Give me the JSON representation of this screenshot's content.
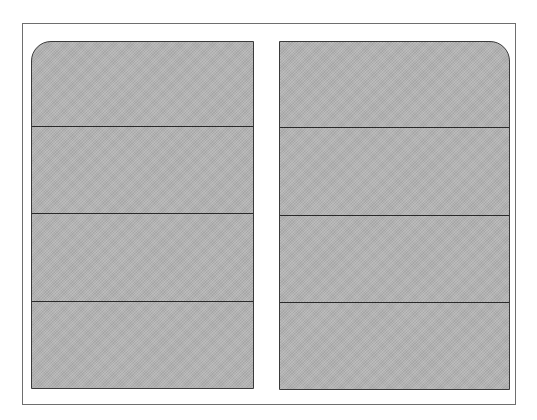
{
  "diagram": {
    "type": "two-panel sectioned layout",
    "frame": {
      "stroke": "#6e6e6e",
      "background": "#ffffff"
    },
    "fill_color": "#b4b4b4",
    "stroke_color": "#2a2a2a",
    "panels": [
      {
        "id": "left",
        "rounded_corner": "top-left",
        "sections": [
          {
            "index": 1,
            "label": ""
          },
          {
            "index": 2,
            "label": ""
          },
          {
            "index": 3,
            "label": ""
          },
          {
            "index": 4,
            "label": ""
          }
        ]
      },
      {
        "id": "right",
        "rounded_corner": "top-right",
        "sections": [
          {
            "index": 1,
            "label": ""
          },
          {
            "index": 2,
            "label": ""
          },
          {
            "index": 3,
            "label": ""
          },
          {
            "index": 4,
            "label": ""
          }
        ]
      }
    ]
  }
}
